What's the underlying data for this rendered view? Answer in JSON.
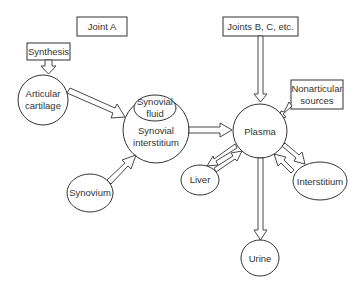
{
  "diagram": {
    "boxes": {
      "joint_a": "Joint A",
      "synthesis": "Synthesis",
      "joints_bc": "Joints B, C, etc.",
      "nonarticular_line1": "Nonarticular",
      "nonarticular_line2": "sources"
    },
    "nodes": {
      "articular_line1": "Articular",
      "articular_line2": "cartilage",
      "synovial_fluid_line1": "Synovial",
      "synovial_fluid_line2": "fluid",
      "synovial_interstitium_line1": "Synovial",
      "synovial_interstitium_line2": "interstitium",
      "synovium": "Synovium",
      "plasma": "Plasma",
      "liver": "Liver",
      "interstitium": "Interstitium",
      "urine": "Urine"
    },
    "colors": {
      "stroke": "#333333",
      "background": "#ffffff"
    }
  }
}
